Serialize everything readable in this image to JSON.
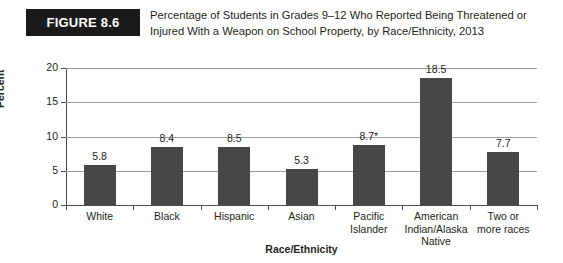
{
  "figure": {
    "badge_label": "FIGURE 8.6",
    "title_line1": "Percentage of Students in Grades 9–12 Who Reported Being Threatened or",
    "title_line2": "Injured With a Weapon on School Property, by Race/Ethnicity, 2013"
  },
  "colors": {
    "bar": "#474747",
    "badge_bg": "#1a1a1a",
    "gridline": "#9d9d9d",
    "axis": "#4d4d4d",
    "text": "#231f20",
    "background": "#ffffff"
  },
  "chart_data": {
    "type": "bar",
    "title": "Percentage of Students in Grades 9–12 Who Reported Being Threatened or Injured With a Weapon on School Property, by Race/Ethnicity, 2013",
    "xlabel": "Race/Ethnicity",
    "ylabel": "Percent",
    "ylim": [
      0,
      20
    ],
    "yticks": [
      0,
      5,
      10,
      15,
      20
    ],
    "ytick_labels": [
      "0",
      "5",
      "10",
      "15",
      "20"
    ],
    "grid": true,
    "grid_axis": "y",
    "legend": false,
    "categories": [
      "White",
      "Black",
      "Hispanic",
      "Asian",
      "Pacific Islander",
      "American Indian/Alaska Native",
      "Two or more races"
    ],
    "category_label_lines": [
      [
        "White"
      ],
      [
        "Black"
      ],
      [
        "Hispanic"
      ],
      [
        "Asian"
      ],
      [
        "Pacific",
        "Islander"
      ],
      [
        "American",
        "Indian/Alaska",
        "Native"
      ],
      [
        "Two or",
        "more races"
      ]
    ],
    "values": [
      5.8,
      8.4,
      8.5,
      5.3,
      8.7,
      18.5,
      7.7
    ],
    "value_labels": [
      "5.8",
      "8.4",
      "8.5",
      "5.3",
      "8.7*",
      "18.5",
      "7.7"
    ],
    "annotations": [
      {
        "category": "Pacific Islander",
        "marker": "*"
      }
    ]
  }
}
